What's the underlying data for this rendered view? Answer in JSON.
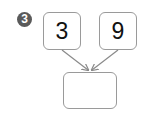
{
  "problem": {
    "number": "3",
    "left_value": "3",
    "right_value": "9",
    "result_value": ""
  },
  "colors": {
    "badge": "#5a5a5a",
    "border": "#9a9a9a",
    "arrow": "#8a8a8a"
  }
}
